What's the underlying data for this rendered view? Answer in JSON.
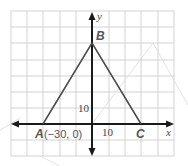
{
  "diagram": {
    "type": "coordinate-plane-triangle",
    "grid": {
      "unit_per_square": 10,
      "x_range_squares": [
        -5,
        5
      ],
      "y_range_squares": [
        -2,
        7
      ]
    },
    "axes": {
      "x_label": "x",
      "y_label": "y"
    },
    "ticks": {
      "x_tick_label": "10",
      "y_tick_label": "10"
    },
    "points": [
      {
        "name": "A",
        "label": "A",
        "coord_label": "(−30, 0)",
        "x": -30,
        "y": 0
      },
      {
        "name": "B",
        "label": "B",
        "x": 0,
        "y": 50
      },
      {
        "name": "C",
        "label": "C",
        "x": 30,
        "y": 0
      }
    ],
    "colors": {
      "grid": "#c8c8c8",
      "axis": "#1a1a1a",
      "triangle": "#4a4a4a",
      "watermark": "#e2e2e2"
    }
  }
}
